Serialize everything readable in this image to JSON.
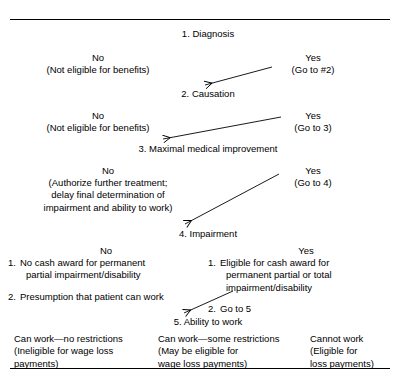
{
  "figure": {
    "type": "flowchart",
    "title_rule_top": true,
    "title_rule_bottom": true
  },
  "nodes": {
    "n1": "1. Diagnosis",
    "n2": "2. Causation",
    "n3": "3. Maximal medical improvement",
    "n4": "4. Impairment",
    "n5": "5. Ability to work"
  },
  "branches": {
    "b1": {
      "no_label": "No",
      "no_detail": "(Not eligible for benefits)",
      "yes_label": "Yes",
      "yes_detail": "(Go to #2)"
    },
    "b2": {
      "no_label": "No",
      "no_detail": "(Not eligible for benefits)",
      "yes_label": "Yes",
      "yes_detail": "(Go to 3)"
    },
    "b3": {
      "no_label": "No",
      "no_detail_line1": "(Authorize further treatment;",
      "no_detail_line2": "delay final determination of",
      "no_detail_line3": "impairment and ability to work)",
      "yes_label": "Yes",
      "yes_detail": "(Go to 4)"
    },
    "b4": {
      "no_label": "No",
      "yes_label": "Yes",
      "no_items": [
        {
          "num": "1.",
          "line1": "No cash award for permanent",
          "line2": "partial impairment/disability"
        },
        {
          "num": "2.",
          "line1": "Presumption that patient can work",
          "line2": ""
        }
      ],
      "yes_items": [
        {
          "num": "1.",
          "line1": "Eligible for cash award for",
          "line2": "permanent partial or total",
          "line3": "impairment/disability"
        },
        {
          "num": "2.",
          "line1": "Go to 5",
          "line2": "",
          "line3": ""
        }
      ]
    }
  },
  "outcomes": [
    {
      "line1": "Can work—no restrictions",
      "line2": "(Ineligible for wage loss",
      "line3": "payments)"
    },
    {
      "line1": "Can work—some restrictions",
      "line2": "(May be eligible for",
      "line3": "wage loss payments)"
    },
    {
      "line1": "Cannot work",
      "line2": "(Eligible for",
      "line3": "loss payments)"
    }
  ],
  "colors": {
    "ink": "#000000",
    "paper": "#ffffff"
  }
}
